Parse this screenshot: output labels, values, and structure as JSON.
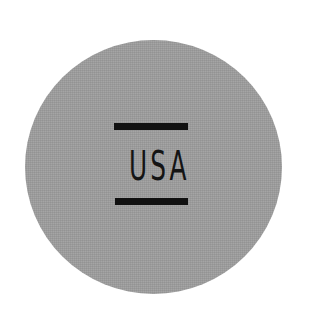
{
  "badge": {
    "text": "USA",
    "background_color": "#9c9c9c",
    "foreground_color": "#111111",
    "shape": "circle"
  }
}
